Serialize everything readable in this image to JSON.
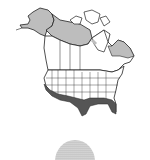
{
  "map": {
    "type": "range-map",
    "region": "North America",
    "colors": {
      "land": "#ffffff",
      "border": "#222222",
      "breeding_range": "#bdbdbd",
      "wintering_range": "#555555",
      "background": "#ffffff"
    },
    "legend": []
  },
  "globe": {
    "type": "thumbnail-globe",
    "color": "#888888"
  }
}
